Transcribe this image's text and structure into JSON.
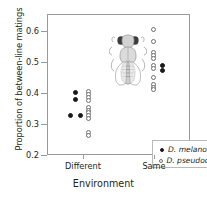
{
  "chart_data": {
    "type": "scatter",
    "title": "",
    "xlabel": "Environment",
    "ylabel": "Proportion of between-line matings",
    "categories": [
      "Different",
      "Same"
    ],
    "yticks": [
      0.2,
      0.3,
      0.4,
      0.5,
      0.6
    ],
    "ytick_labels": [
      "0.2",
      "0.3",
      "0.4",
      "0.5",
      "0.6"
    ],
    "ylim": [
      0.2,
      0.655
    ],
    "grid": false,
    "legend_position": "lower-right",
    "series": [
      {
        "name": "D. melanogaster",
        "marker": "filled-circle",
        "color": "#1a1a1a",
        "points": [
          {
            "category": "Different",
            "x_offset": -0.12,
            "y": 0.405
          },
          {
            "category": "Different",
            "x_offset": -0.12,
            "y": 0.383
          },
          {
            "category": "Different",
            "x_offset": -0.19,
            "y": 0.331
          },
          {
            "category": "Different",
            "x_offset": -0.05,
            "y": 0.331
          },
          {
            "category": "Same",
            "x_offset": 0.1,
            "y": 0.492
          },
          {
            "category": "Same",
            "x_offset": 0.1,
            "y": 0.477
          }
        ]
      },
      {
        "name": "D. pseudoobscura",
        "marker": "open-circle",
        "color": "#6e6e6e",
        "points": [
          {
            "category": "Different",
            "x_offset": 0.06,
            "y": 0.408
          },
          {
            "category": "Different",
            "x_offset": 0.06,
            "y": 0.397
          },
          {
            "category": "Different",
            "x_offset": 0.06,
            "y": 0.388
          },
          {
            "category": "Different",
            "x_offset": 0.06,
            "y": 0.379
          },
          {
            "category": "Different",
            "x_offset": 0.06,
            "y": 0.357
          },
          {
            "category": "Different",
            "x_offset": 0.06,
            "y": 0.348
          },
          {
            "category": "Different",
            "x_offset": 0.06,
            "y": 0.339
          },
          {
            "category": "Different",
            "x_offset": 0.06,
            "y": 0.33
          },
          {
            "category": "Different",
            "x_offset": 0.06,
            "y": 0.321
          },
          {
            "category": "Different",
            "x_offset": 0.06,
            "y": 0.277
          },
          {
            "category": "Different",
            "x_offset": 0.06,
            "y": 0.266
          },
          {
            "category": "Same",
            "x_offset": -0.02,
            "y": 0.607
          },
          {
            "category": "Same",
            "x_offset": -0.02,
            "y": 0.568
          },
          {
            "category": "Same",
            "x_offset": -0.02,
            "y": 0.534
          },
          {
            "category": "Same",
            "x_offset": -0.02,
            "y": 0.524
          },
          {
            "category": "Same",
            "x_offset": -0.02,
            "y": 0.514
          },
          {
            "category": "Same",
            "x_offset": -0.02,
            "y": 0.492
          },
          {
            "category": "Same",
            "x_offset": -0.02,
            "y": 0.482
          },
          {
            "category": "Same",
            "x_offset": -0.02,
            "y": 0.452
          },
          {
            "category": "Same",
            "x_offset": -0.02,
            "y": 0.432
          },
          {
            "category": "Same",
            "x_offset": -0.02,
            "y": 0.422
          },
          {
            "category": "Same",
            "x_offset": -0.02,
            "y": 0.413
          }
        ]
      }
    ],
    "annotations": [
      {
        "name": "fly-illustration",
        "description": "Drosophila fly illustration, dorsal view",
        "position": "upper-left inside axes"
      }
    ]
  },
  "legend": {
    "entries": [
      {
        "label": "D. melanogaster",
        "marker": "filled-circle"
      },
      {
        "label": "D. pseudoobscura",
        "marker": "open-circle"
      }
    ]
  }
}
